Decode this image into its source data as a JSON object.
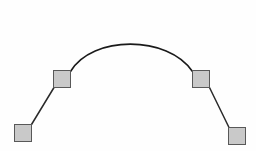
{
  "canvas": {
    "width": 256,
    "height": 151,
    "background_color": "#fefefe",
    "name": "bezier-curve-canvas"
  },
  "styles": {
    "handle_fill": "#c9c9c9",
    "handle_border": "#585858",
    "curve_stroke": "#1a1a1a",
    "tangent_stroke": "#2a2a2a",
    "curve_width": 1.6,
    "tangent_width": 1.5
  },
  "curve": {
    "type": "cubic-bezier-arc",
    "description": "Symmetric arch curve",
    "path": "M 70.5 71.5 C 92 35, 168 35, 192.5 71.5",
    "start_point": {
      "x": 70.5,
      "y": 71.5
    },
    "control_point_1": {
      "x": 92,
      "y": 35
    },
    "control_point_2": {
      "x": 168,
      "y": 35
    },
    "end_point": {
      "x": 192.5,
      "y": 71.5
    },
    "apex": {
      "x": 130,
      "y": 29
    }
  },
  "tangent_lines": [
    {
      "label": "left-tangent-line",
      "from": {
        "x": 31.5,
        "y": 124.5
      },
      "to": {
        "x": 54.0,
        "y": 87.5
      }
    },
    {
      "label": "right-tangent-line",
      "from": {
        "x": 209.5,
        "y": 87.5
      },
      "to": {
        "x": 229.0,
        "y": 127.5
      }
    }
  ],
  "handles": [
    {
      "id": "handle-1",
      "role": "anchor-point-start",
      "label": "Bottom left anchor handle",
      "x": 14,
      "y": 124,
      "size": 18
    },
    {
      "id": "handle-2",
      "role": "control-point-left",
      "label": "Upper left control handle",
      "x": 53,
      "y": 70,
      "size": 18
    },
    {
      "id": "handle-3",
      "role": "control-point-right",
      "label": "Upper right control handle",
      "x": 192,
      "y": 70,
      "size": 18
    },
    {
      "id": "handle-4",
      "role": "anchor-point-end",
      "label": "Bottom right anchor handle",
      "x": 228,
      "y": 127,
      "size": 18
    }
  ]
}
